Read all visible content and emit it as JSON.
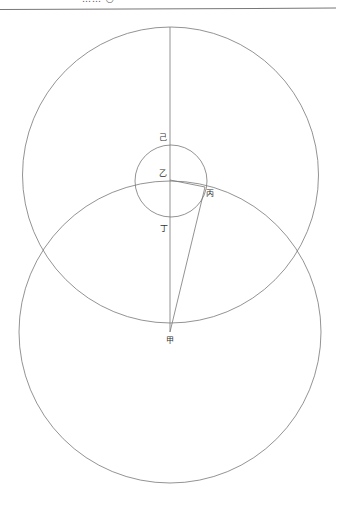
{
  "header": {
    "text": "……  ○  ·",
    "rule": true
  },
  "diagram": {
    "stroke_color": "#777777",
    "circles": [
      {
        "name": "upper-circle",
        "cx": 170.5,
        "cy": 175,
        "r": 148
      },
      {
        "name": "lower-circle",
        "cx": 170,
        "cy": 332,
        "r": 151
      },
      {
        "name": "inner-circle",
        "cx": 171,
        "cy": 181,
        "r": 36
      }
    ],
    "lines": [
      {
        "name": "vertical-diameter",
        "x1": 170,
        "y1": 27,
        "x2": 170,
        "y2": 332
      },
      {
        "name": "line-yi-bing",
        "x1": 170,
        "y1": 180,
        "x2": 205,
        "y2": 187
      },
      {
        "name": "line-bing-jia",
        "x1": 205,
        "y1": 187,
        "x2": 170,
        "y2": 332
      }
    ],
    "labels": {
      "ji": {
        "text": "己",
        "x": 159,
        "y": 140
      },
      "yi": {
        "text": "乙",
        "x": 159,
        "y": 176
      },
      "bing": {
        "text": "丙",
        "x": 206,
        "y": 196
      },
      "ding": {
        "text": "丁",
        "x": 160,
        "y": 231
      },
      "jia": {
        "text": "甲",
        "x": 166,
        "y": 343
      }
    }
  }
}
